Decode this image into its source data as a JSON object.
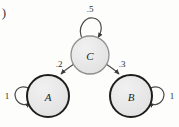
{
  "figure": {
    "enumerator": ")",
    "type": "state-transition-diagram",
    "background_color": "#fdfdfc"
  },
  "style": {
    "node_fill": "#e7e7e7",
    "node_stroke_thick": "#1d1d1d",
    "node_stroke_thin": "#8f8f8f",
    "edge_color": "#4a4a4a",
    "label_color": "#1b1b1b"
  },
  "nodes": [
    {
      "id": "A",
      "label": "A",
      "cx": 48,
      "cy": 96,
      "r": 21,
      "emphasis": "thick"
    },
    {
      "id": "B",
      "label": "B",
      "cx": 131,
      "cy": 96,
      "r": 21,
      "emphasis": "thick"
    },
    {
      "id": "C",
      "label": "C",
      "cx": 90,
      "cy": 55,
      "r": 19,
      "emphasis": "thin"
    }
  ],
  "edges": [
    {
      "id": "c-self",
      "from": "C",
      "to": "C",
      "weight": ".5",
      "kind": "self-loop",
      "position": "top",
      "label_x": 90,
      "label_y": 9
    },
    {
      "id": "c-to-a",
      "from": "C",
      "to": "A",
      "weight": ".2",
      "kind": "arc",
      "label_x": 59,
      "label_y": 64
    },
    {
      "id": "c-to-b",
      "from": "C",
      "to": "B",
      "weight": ".3",
      "kind": "arc",
      "label_x": 122,
      "label_y": 64
    },
    {
      "id": "a-self",
      "from": "A",
      "to": "A",
      "weight": "1",
      "kind": "self-loop",
      "position": "left",
      "label_x": 7,
      "label_y": 96
    },
    {
      "id": "b-self",
      "from": "B",
      "to": "B",
      "weight": "1",
      "kind": "self-loop",
      "position": "right",
      "label_x": 172,
      "label_y": 96
    }
  ]
}
